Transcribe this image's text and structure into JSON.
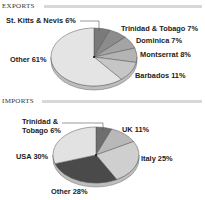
{
  "sections": {
    "exports": {
      "title": "EXPORTS"
    },
    "imports": {
      "title": "IMPORTS"
    }
  },
  "labels": {
    "exports": {
      "stkitts": "St. Kitts & Nevis 6%",
      "trinidad": "Trinidad & Tobago 7%",
      "dominica": "Dominica 7%",
      "montserrat": "Montserrat 8%",
      "barbados": "Barbados 11%",
      "other": "Other 61%"
    },
    "imports": {
      "trinidad_line1": "Trinidad &",
      "trinidad_line2": "Tobago 6%",
      "uk": "UK 11%",
      "italy": "Italy 25%",
      "other": "Other 28%",
      "usa": "USA 30%"
    }
  },
  "chart_data": [
    {
      "type": "pie",
      "title": "EXPORTS",
      "categories": [
        "St. Kitts & Nevis",
        "Trinidad & Tobago",
        "Dominica",
        "Montserrat",
        "Barbados",
        "Other"
      ],
      "values": [
        6,
        7,
        7,
        8,
        11,
        61
      ],
      "unit": "%",
      "colors": [
        "#7a7a7a",
        "#8c8c8c",
        "#a4a4a4",
        "#b4b4b4",
        "#c6c6c6",
        "#e4e4e4"
      ],
      "style": "3d-tilted"
    },
    {
      "type": "pie",
      "title": "IMPORTS",
      "categories": [
        "Trinidad & Tobago",
        "UK",
        "Italy",
        "Other",
        "USA"
      ],
      "values": [
        6,
        11,
        25,
        28,
        30
      ],
      "unit": "%",
      "colors": [
        "#6e6e6e",
        "#b8b8b8",
        "#cfcfcf",
        "#4a4a4a",
        "#e2e2e2"
      ],
      "style": "3d-tilted"
    }
  ]
}
